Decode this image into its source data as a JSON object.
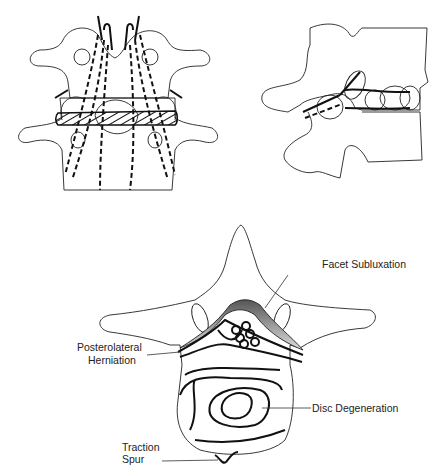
{
  "figure": {
    "panels": [
      {
        "id": "posterior-view",
        "description": "Posterior view of two lumbar vertebrae with hatched disc and dashed nerve roots"
      },
      {
        "id": "lateral-view",
        "description": "Lateral view of vertebrae showing foramen and disc"
      },
      {
        "id": "axial-view",
        "description": "Axial view of vertebra with labeled pathology"
      }
    ],
    "labels": {
      "facet_subluxation": "Facet Subluxation",
      "posterolateral_herniation_line1": "Posterolateral",
      "posterolateral_herniation_line2": "Herniation",
      "disc_degeneration": "Disc Degeneration",
      "traction_spur_line1": "Traction",
      "traction_spur_line2": "Spur"
    }
  }
}
